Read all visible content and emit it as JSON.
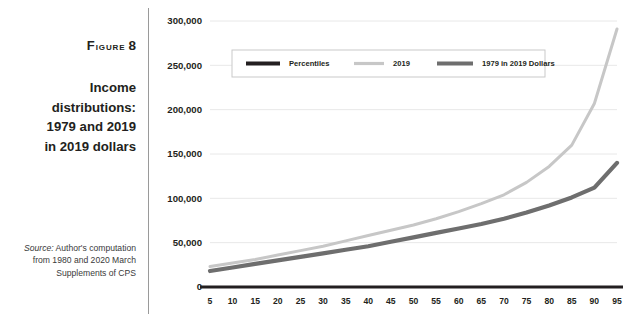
{
  "figure": {
    "label_prefix": "Figure",
    "label_number": "8",
    "title_lines": [
      "Income",
      "distributions:",
      "1979 and 2019",
      "in 2019 dollars"
    ],
    "source_prefix": "Source:",
    "source_text": " Author's computation from 1980 and 2020 March Supplements of CPS"
  },
  "colors": {
    "percentiles": "#231f20",
    "series_2019": "#c7c7c7",
    "series_1979": "#6e6e6e",
    "grid": "#e8e8e8",
    "axis": "#231f20",
    "text": "#231f20",
    "divider": "#9a9a9a"
  },
  "chart_data": {
    "type": "line",
    "title": "Income distributions: 1979 and 2019 in 2019 dollars",
    "xlabel": "",
    "ylabel": "",
    "grid": true,
    "legend_position": "top-center",
    "xlim": [
      5,
      95
    ],
    "ylim": [
      0,
      300000
    ],
    "yticks": [
      0,
      50000,
      100000,
      150000,
      200000,
      250000,
      300000
    ],
    "ytick_labels": [
      "0",
      "50,000",
      "100,000",
      "150,000",
      "200,000",
      "250,000",
      "300,000"
    ],
    "categories": [
      5,
      10,
      15,
      20,
      25,
      30,
      35,
      40,
      45,
      50,
      55,
      60,
      65,
      70,
      75,
      80,
      85,
      90,
      95
    ],
    "xtick_labels": [
      "5",
      "10",
      "15",
      "20",
      "25",
      "30",
      "35",
      "40",
      "45",
      "50",
      "55",
      "60",
      "65",
      "70",
      "75",
      "80",
      "85",
      "90",
      "95"
    ],
    "series": [
      {
        "name": "Percentiles",
        "color": "#231f20",
        "width": 3.2,
        "values": [
          0,
          0,
          0,
          0,
          0,
          0,
          0,
          0,
          0,
          0,
          0,
          0,
          0,
          0,
          0,
          0,
          0,
          0,
          0
        ]
      },
      {
        "name": "2019",
        "color": "#c7c7c7",
        "width": 3.0,
        "values": [
          23000,
          27000,
          31000,
          36000,
          41000,
          46000,
          52000,
          58000,
          64000,
          70000,
          77000,
          85000,
          94000,
          104000,
          118000,
          136000,
          160000,
          207000,
          291000
        ]
      },
      {
        "name": "1979 in 2019 Dollars",
        "color": "#6e6e6e",
        "width": 4.2,
        "values": [
          18000,
          22000,
          26000,
          30000,
          34000,
          38000,
          42000,
          46000,
          51000,
          56000,
          61000,
          66000,
          71000,
          77000,
          84000,
          92000,
          101000,
          112000,
          140000
        ]
      }
    ]
  }
}
